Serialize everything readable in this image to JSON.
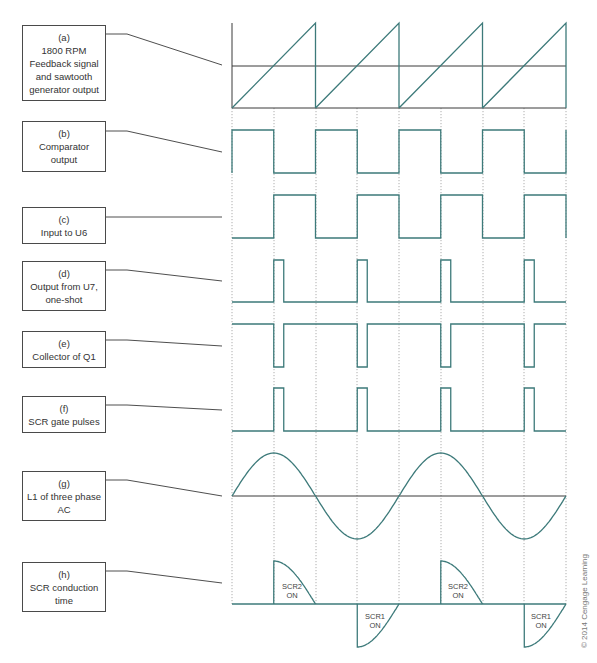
{
  "colors": {
    "wave": "#3d7a7a",
    "axis": "#3a3a3a",
    "leader": "#3a3a3a",
    "guide": "#9a9a9a",
    "box_border": "#4a4a4a",
    "text": "#333333"
  },
  "labels": [
    {
      "id": "a",
      "tag": "(a)",
      "lines": [
        "1800 RPM",
        "Feedback signal",
        "and sawtooth",
        "generator output"
      ]
    },
    {
      "id": "b",
      "tag": "(b)",
      "lines": [
        "Comparator",
        "output"
      ]
    },
    {
      "id": "c",
      "tag": "(c)",
      "lines": [
        "Input to U6"
      ]
    },
    {
      "id": "d",
      "tag": "(d)",
      "lines": [
        "Output from U7,",
        "one-shot"
      ]
    },
    {
      "id": "e",
      "tag": "(e)",
      "lines": [
        "Collector of Q1"
      ]
    },
    {
      "id": "f",
      "tag": "(f)",
      "lines": [
        "SCR gate pulses"
      ]
    },
    {
      "id": "g",
      "tag": "(g)",
      "lines": [
        "L1 of three phase",
        "AC"
      ]
    },
    {
      "id": "h",
      "tag": "(h)",
      "lines": [
        "SCR conduction",
        "time"
      ]
    }
  ],
  "waveform_annotations": [
    {
      "text": [
        "SCR2",
        "ON"
      ]
    },
    {
      "text": [
        "SCR1",
        "ON"
      ]
    },
    {
      "text": [
        "SCR2",
        "ON"
      ]
    },
    {
      "text": [
        "SCR1",
        "ON"
      ]
    }
  ],
  "copyright": "© 2014 Cengage Learning",
  "timing": {
    "x_start": 232,
    "half_period_px": 41.75,
    "guide_x": [
      232,
      274,
      316,
      357,
      399,
      441,
      483,
      524,
      566
    ],
    "cycles": 4
  },
  "signals": {
    "a": {
      "type": "sawtooth",
      "reference_level": "midpoint",
      "ramps": 4
    },
    "b": {
      "type": "square",
      "starts": "high",
      "duty": 0.5,
      "cycles": 4
    },
    "c": {
      "type": "square",
      "starts": "low",
      "duty": 0.5,
      "cycles": 4
    },
    "d": {
      "type": "pulse",
      "polarity": "positive",
      "count": 4,
      "pulse_width_px": 10
    },
    "e": {
      "type": "pulse",
      "polarity": "negative",
      "count": 4,
      "pulse_width_px": 10
    },
    "f": {
      "type": "pulse",
      "polarity": "positive",
      "count": 4,
      "pulse_width_px": 10
    },
    "g": {
      "type": "sine",
      "cycles": 2
    },
    "h": {
      "type": "scr_conduction",
      "segments": [
        "SCR2 ON",
        "SCR1 ON",
        "SCR2 ON",
        "SCR1 ON"
      ]
    }
  }
}
